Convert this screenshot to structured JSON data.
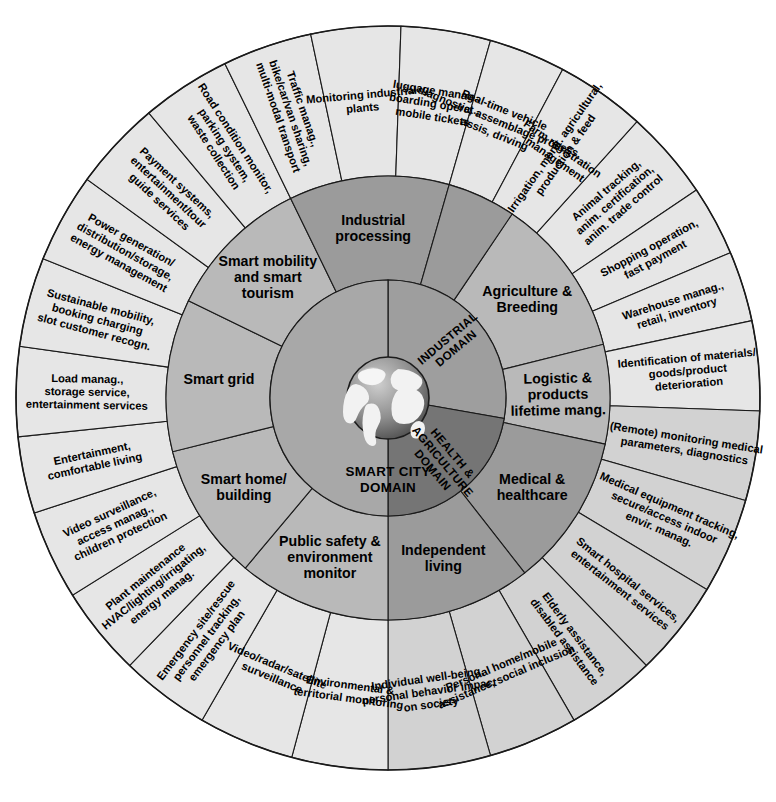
{
  "diagram": {
    "type": "sunburst",
    "center_label": "SMART CITY DOMAIN",
    "globe": "globe-earth-icon",
    "colors": {
      "core_industrial": "#9e9e9e",
      "core_health_agriculture": "#757575",
      "core_smart_city": "#a8a8a8",
      "ring_mid_light": "#b9b9b9",
      "ring_mid_dark": "#9b9b9b",
      "ring_outer_light": "#e6e6e6",
      "ring_outer_dark": "#d2d2d2",
      "stroke": "#1a1a1a"
    }
  },
  "core": [
    {
      "id": "industrial",
      "label": "INDUSTRIAL\nDOMAIN",
      "start": -90,
      "end": 10,
      "shade": "core-a"
    },
    {
      "id": "health-agri",
      "label": "HEALTH &\nAGRICULTURE\nDOMAIN",
      "start": 10,
      "end": 90,
      "shade": "core-b"
    },
    {
      "id": "smart-city",
      "label": "SMART CITY\nDOMAIN",
      "start": 90,
      "end": 270,
      "shade": "core-c"
    }
  ],
  "middle": [
    {
      "id": "agriculture-breeding",
      "label": "Agriculture &\nBreeding",
      "start": -56,
      "end": -14,
      "shade": "seg-mid"
    },
    {
      "id": "logistic-products",
      "label": "Logistic &\nproducts\nlifetime mang.",
      "start": -14,
      "end": 12,
      "shade": "seg-mid"
    },
    {
      "id": "medical-healthcare",
      "label": "Medical &\nhealthcare",
      "start": 12,
      "end": 52,
      "shade": "seg-mid-dk"
    },
    {
      "id": "independent-living",
      "label": "Independent\nliving",
      "start": 52,
      "end": 90,
      "shade": "seg-mid-dk"
    },
    {
      "id": "public-safety-environment",
      "label": "Public safety &\nenvironment\nmonitor",
      "start": 90,
      "end": 130,
      "shade": "seg-mid"
    },
    {
      "id": "smart-home-building",
      "label": "Smart home/\nbuilding",
      "start": 130,
      "end": 166,
      "shade": "seg-mid"
    },
    {
      "id": "smart-grid",
      "label": "Smart grid",
      "start": 166,
      "end": 206,
      "shade": "seg-mid"
    },
    {
      "id": "smart-mobility-tourism",
      "label": "Smart mobility\nand smart\ntourism",
      "start": 206,
      "end": 244,
      "shade": "seg-mid"
    },
    {
      "id": "industrial-processing",
      "label": "Industrial\nprocessing",
      "start": 244,
      "end": 286,
      "shade": "seg-mid-dk"
    },
    {
      "id": "industrial-processing-pad",
      "label": "",
      "start": 286,
      "end": 304,
      "shade": "seg-mid-dk"
    }
  ],
  "outer": [
    {
      "id": "irrigation-monit",
      "label": "Irrigation, monit. agricultural,\nproduction & feed",
      "start": -62,
      "end": -48,
      "shade": "seg-outer",
      "mode": "radial"
    },
    {
      "id": "animal-tracking",
      "label": "Animal tracking,\nanim. certification,\nanim. trade control",
      "start": -48,
      "end": -34,
      "shade": "seg-outer",
      "mode": "radial"
    },
    {
      "id": "shopping-operation",
      "label": "Shopping operation,\nfast payment",
      "start": -34,
      "end": -23,
      "shade": "seg-outer",
      "mode": "radial"
    },
    {
      "id": "warehouse-manag",
      "label": "Warehouse manag.,\nretail, inventory",
      "start": -23,
      "end": -12,
      "shade": "seg-outer",
      "mode": "radial"
    },
    {
      "id": "identification-materials",
      "label": "Identification of materials/\ngoods/product\ndeterioration",
      "start": -12,
      "end": 2,
      "shade": "seg-outer",
      "mode": "radial"
    },
    {
      "id": "remote-monitoring",
      "label": "(Remote) monitoring medical\nparameters, diagnostics",
      "start": 2,
      "end": 16,
      "shade": "seg-outer-dk",
      "mode": "radial"
    },
    {
      "id": "medical-equipment",
      "label": "Medical equipment tracking,\nsecure/access indoor\nenvir. manag.",
      "start": 16,
      "end": 31,
      "shade": "seg-outer-dk",
      "mode": "radial"
    },
    {
      "id": "smart-hospital",
      "label": "Smart hospital services,\nentertainment services",
      "start": 31,
      "end": 46,
      "shade": "seg-outer-dk",
      "mode": "radial"
    },
    {
      "id": "elderly-assistance",
      "label": "Elderly assistance,\ndisabled assistance",
      "start": 46,
      "end": 60,
      "shade": "seg-outer-dk",
      "mode": "radial"
    },
    {
      "id": "personal-home-mobile",
      "label": "Personal home/mobile\nassistance, social inclusion",
      "start": 60,
      "end": 74,
      "shade": "seg-outer-dk",
      "mode": "tangent"
    },
    {
      "id": "individual-wellbeing",
      "label": "Individual well-being,\npersonal behavior impact\non society",
      "start": 74,
      "end": 90,
      "shade": "seg-outer-dk",
      "mode": "tangent"
    },
    {
      "id": "environmental-monitoring",
      "label": "Environmental &\nterritorial monitoring",
      "start": 90,
      "end": 105,
      "shade": "seg-outer",
      "mode": "tangent"
    },
    {
      "id": "video-radar-satellite",
      "label": "Video/radar/satellite\nsurveillance",
      "start": 105,
      "end": 120,
      "shade": "seg-outer",
      "mode": "tangent"
    },
    {
      "id": "emergency-site-rescue",
      "label": "Emergency site/rescue\npersonnel tracking,\nemergency plan",
      "start": 120,
      "end": 134,
      "shade": "seg-outer",
      "mode": "radial"
    },
    {
      "id": "plant-maintenance",
      "label": "Plant maintenance\nHVAC/lighting/irrigating,\nenergy manag.",
      "start": 134,
      "end": 148,
      "shade": "seg-outer",
      "mode": "radial"
    },
    {
      "id": "video-surveillance",
      "label": "Video surveillance,\naccess manag.,\nchildren protection",
      "start": 148,
      "end": 162,
      "shade": "seg-outer",
      "mode": "radial"
    },
    {
      "id": "entertainment-living",
      "label": "Entertainment,\ncomfortable living",
      "start": 162,
      "end": 174,
      "shade": "seg-outer",
      "mode": "radial"
    },
    {
      "id": "load-manag-storage",
      "label": "Load manag.,\nstorage service,\nentertainment services",
      "start": 174,
      "end": 188,
      "shade": "seg-outer",
      "mode": "radial"
    },
    {
      "id": "sustainable-mobility",
      "label": "Sustainable mobility,\nbooking charging\nslot customer recogn.",
      "start": 188,
      "end": 202,
      "shade": "seg-outer",
      "mode": "radial"
    },
    {
      "id": "power-generation",
      "label": "Power generation/\ndistribution/storage,\nenergy management",
      "start": 202,
      "end": 216,
      "shade": "seg-outer",
      "mode": "radial"
    },
    {
      "id": "payment-systems",
      "label": "Payment systems,\nentertainment/tour\nguide services",
      "start": 216,
      "end": 230,
      "shade": "seg-outer",
      "mode": "radial"
    },
    {
      "id": "road-condition",
      "label": "Road condition monitor,\nparking system,\nwaste collection",
      "start": 230,
      "end": 244,
      "shade": "seg-outer",
      "mode": "radial"
    },
    {
      "id": "traffic-manag",
      "label": "Traffic manag.,\nbike/car/van sharing,\nmulti-modal transport",
      "start": 244,
      "end": 258,
      "shade": "seg-outer",
      "mode": "radial"
    },
    {
      "id": "monitoring-industrial",
      "label": "Monitoring industrial\nplants",
      "start": 258,
      "end": 272,
      "shade": "seg-outer",
      "mode": "tangent"
    },
    {
      "id": "luggage-manag",
      "label": "luggage manag.,\nboarding operat.,\nmobile tickets",
      "start": 272,
      "end": 286,
      "shade": "seg-outer",
      "mode": "tangent"
    },
    {
      "id": "realtime-vehicle",
      "label": "Real-time vehicle\ndiagnostic, assemblage process,\nassis, driving",
      "start": 286,
      "end": 298,
      "shade": "seg-outer",
      "mode": "tangent"
    },
    {
      "id": "farm-registration",
      "label": "Farm registration\nmanagement",
      "start": 298,
      "end": 312,
      "shade": "seg-outer",
      "mode": "tangent"
    }
  ],
  "geometry": {
    "cx": 388,
    "cy": 398,
    "r_globe": 42,
    "r_core": 118,
    "r_mid": 222,
    "r_outer": 372
  }
}
